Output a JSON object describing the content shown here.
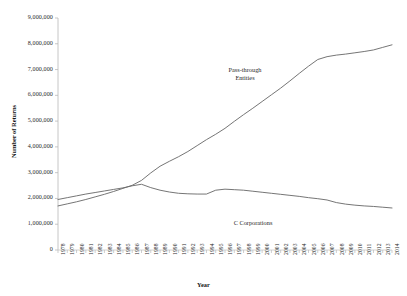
{
  "chart_data": {
    "type": "line",
    "title": "",
    "xlabel": "Year",
    "ylabel": "Number of Returns",
    "grid": false,
    "legend_position": "inline-annotation",
    "ylim": [
      0,
      9000000
    ],
    "ytick_labels": [
      "9,000,000",
      "8,000,000",
      "7,000,000",
      "6,000,000",
      "5,000,000",
      "4,000,000",
      "3,000,000",
      "2,000,000",
      "1,000,000",
      "0"
    ],
    "ytick_values": [
      9000000,
      8000000,
      7000000,
      6000000,
      5000000,
      4000000,
      3000000,
      2000000,
      1000000,
      0
    ],
    "x": [
      "1978",
      "1979",
      "1980",
      "1981",
      "1982",
      "1983",
      "1984",
      "1985",
      "1986",
      "1987",
      "1988",
      "1989",
      "1990",
      "1991",
      "1992",
      "1993",
      "1994",
      "1995",
      "1996",
      "1997",
      "1998",
      "1999",
      "2000",
      "2001",
      "2002",
      "2003",
      "2004",
      "2005",
      "2006",
      "2007",
      "2008",
      "2009",
      "2010",
      "2011",
      "2012",
      "2013",
      "2014"
    ],
    "series": [
      {
        "name": "Pass-through Entities",
        "color": "#6e6e6e",
        "values": [
          1710000,
          1790000,
          1870000,
          1960000,
          2060000,
          2160000,
          2270000,
          2390000,
          2510000,
          2700000,
          2990000,
          3250000,
          3440000,
          3620000,
          3820000,
          4050000,
          4280000,
          4490000,
          4720000,
          4990000,
          5250000,
          5500000,
          5760000,
          6020000,
          6280000,
          6560000,
          6850000,
          7130000,
          7390000,
          7500000,
          7560000,
          7600000,
          7650000,
          7700000,
          7760000,
          7860000,
          7960000
        ]
      },
      {
        "name": "C Corporations",
        "color": "#6e6e6e",
        "values": [
          1960000,
          2030000,
          2100000,
          2170000,
          2230000,
          2290000,
          2350000,
          2410000,
          2490000,
          2550000,
          2420000,
          2320000,
          2250000,
          2200000,
          2180000,
          2170000,
          2170000,
          2320000,
          2360000,
          2340000,
          2320000,
          2280000,
          2240000,
          2200000,
          2160000,
          2120000,
          2080000,
          2030000,
          1990000,
          1940000,
          1840000,
          1780000,
          1740000,
          1710000,
          1690000,
          1660000,
          1630000
        ]
      }
    ],
    "annotations": [
      {
        "text": "Pass-through\nEntities",
        "series": "Pass-through Entities"
      },
      {
        "text": "C Corporations",
        "series": "C Corporations"
      }
    ],
    "axis_color": "#b9b9b9",
    "tick_color": "#b9b9b9"
  }
}
